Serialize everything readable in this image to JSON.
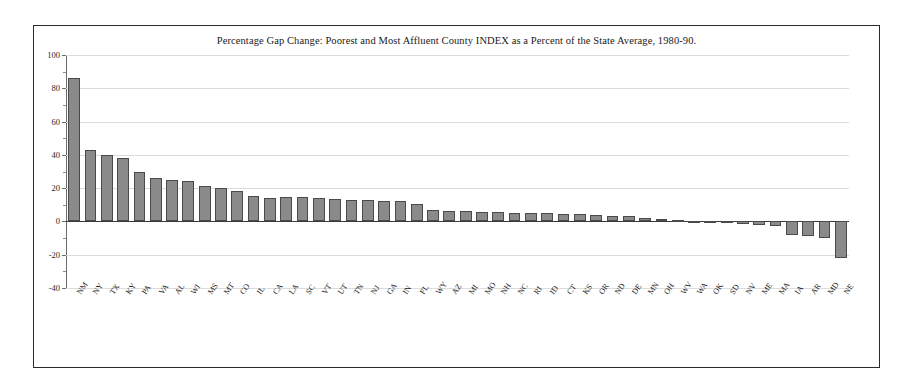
{
  "figure": {
    "title": "Percentage Gap Change: Poorest and Most Affluent County INDEX as a Percent of the State Average, 1980-90.",
    "frame_color": "#2b2b2b",
    "background": "#ffffff"
  },
  "axis": {
    "y_tick_labels": [
      "100",
      "80",
      "60",
      "40",
      "20",
      "0",
      "-20",
      "-40"
    ],
    "y_tick_values": [
      100,
      80,
      60,
      40,
      20,
      0,
      -20,
      -40
    ]
  },
  "style": {
    "bar_fill": "#8a8a8a",
    "bar_border": "#4a4a4a",
    "gridline_color": "#dcdcdc",
    "zero_line_color": "#3a3a3a",
    "axis_color": "#6b6b6b"
  },
  "chart_data": {
    "type": "bar",
    "title": "Percentage Gap Change: Poorest and Most Affluent County INDEX as a Percent of the State Average, 1980-90.",
    "xlabel": "",
    "ylabel": "",
    "ylim": [
      -40,
      100
    ],
    "ytick_step": 20,
    "grid": true,
    "legend": null,
    "orientation": "vertical",
    "sorted": "descending",
    "categories": [
      "NM",
      "NY",
      "TX",
      "KY",
      "PA",
      "VA",
      "AL",
      "WI",
      "MS",
      "MT",
      "CO",
      "IL",
      "CA",
      "LA",
      "SC",
      "VT",
      "UT",
      "TN",
      "NJ",
      "GA",
      "IN",
      "FL",
      "WY",
      "AZ",
      "MI",
      "MO",
      "NH",
      "NC",
      "RI",
      "ID",
      "CT",
      "KS",
      "OR",
      "ND",
      "DE",
      "MN",
      "OH",
      "WV",
      "WA",
      "OK",
      "SD",
      "NV",
      "ME",
      "MA",
      "IA",
      "AR",
      "MD",
      "NE"
    ],
    "values": [
      86,
      43,
      40,
      38,
      30,
      26,
      25,
      24,
      21,
      20,
      18,
      15,
      14,
      14.5,
      14.5,
      14,
      13.5,
      13,
      13,
      12.5,
      12,
      10.5,
      7,
      6.5,
      6,
      5.5,
      5.5,
      5,
      5,
      5,
      4.5,
      4.5,
      4,
      3.5,
      3,
      2,
      1.5,
      1,
      0.5,
      -0.5,
      -1,
      -1.5,
      -2,
      -3,
      -8,
      -8.5,
      -10,
      -22
    ]
  }
}
